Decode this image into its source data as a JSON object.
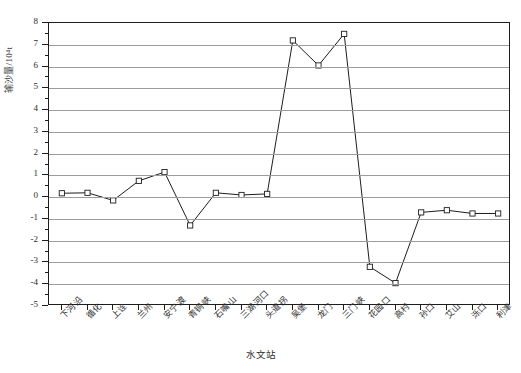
{
  "chart_data": {
    "type": "line",
    "title": "",
    "xlabel": "水文站",
    "ylabel": "输沙量/10⁴t",
    "ylim": [
      -5,
      8
    ],
    "ytick_values": [
      8,
      7,
      6,
      5,
      4,
      3,
      2,
      1,
      0,
      -1,
      -2,
      -3,
      -4,
      -5
    ],
    "ytick_labels": [
      "8",
      "7",
      "6",
      "5",
      "4",
      "3",
      "2",
      "1",
      "0",
      "-1",
      "-2",
      "-3",
      "-4",
      "-5"
    ],
    "grid": true,
    "legend": "none",
    "marker": "open-square",
    "line_color": "#1d1d1d",
    "grid_color": "#9c9c9c",
    "categories": [
      "下河沿",
      "循化",
      "上诠",
      "兰州",
      "安宁渡",
      "青铜峡",
      "石嘴山",
      "三湖河口",
      "头道拐",
      "吴堡",
      "龙门",
      "三门峡",
      "花园口",
      "高村",
      "孙口",
      "艾山",
      "泺口",
      "利津"
    ],
    "values": [
      0.18,
      0.2,
      -0.15,
      0.75,
      1.15,
      -1.3,
      0.2,
      0.1,
      0.15,
      7.2,
      6.05,
      7.5,
      -3.2,
      -3.95,
      -0.7,
      -0.6,
      -0.75,
      -0.75
    ]
  }
}
